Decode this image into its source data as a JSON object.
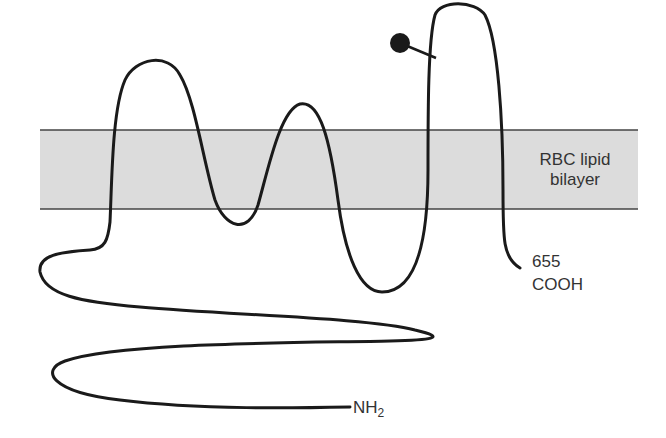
{
  "diagram": {
    "membrane": {
      "label_line1": "RBC lipid",
      "label_line2": "bilayer",
      "fill": "#dcdcdc",
      "border": "#444444"
    },
    "c_terminus": {
      "residue": "655",
      "group": "COOH"
    },
    "n_terminus": {
      "group": "NH",
      "subscript": "2"
    },
    "chain_color": "#1a1a1a",
    "glycosylation_marker": "filled-circle"
  }
}
